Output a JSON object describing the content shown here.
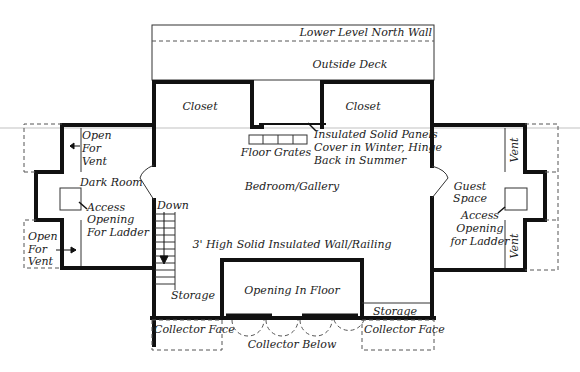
{
  "diagram": {
    "type": "floor-plan",
    "labels": {
      "north_wall": "Lower Level North Wall",
      "outside_deck": "Outside Deck",
      "closet_left": "Closet",
      "closet_right": "Closet",
      "floor_grates": "Floor Grates",
      "panels_line1": "Insulated Solid Panels",
      "panels_line2": "Cover in Winter, Hinge",
      "panels_line3": "Back in Summer",
      "bedroom": "Bedroom/Gallery",
      "vent_left_top_1": "Open",
      "vent_left_top_2": "For",
      "vent_left_top_3": "Vent",
      "dark_room": "Dark Room",
      "access_left_1": "Access",
      "access_left_2": "Opening",
      "access_left_3": "For Ladder",
      "vent_left_bottom_1": "Open",
      "vent_left_bottom_2": "For",
      "vent_left_bottom_3": "Vent",
      "down": "Down",
      "storage_left": "Storage",
      "railing": "3' High Solid Insulated Wall/Railing",
      "opening_in_floor": "Opening In Floor",
      "storage_right": "Storage",
      "guest_space_1": "Guest",
      "guest_space_2": "Space",
      "access_right_1": "Access",
      "access_right_2": "Opening",
      "access_right_3": "for Ladder",
      "vent_right_top": "Vent",
      "vent_right_bottom": "Vent",
      "collector_face_left": "Collector Face",
      "collector_face_right": "Collector Face",
      "collector_below": "Collector Below"
    }
  }
}
